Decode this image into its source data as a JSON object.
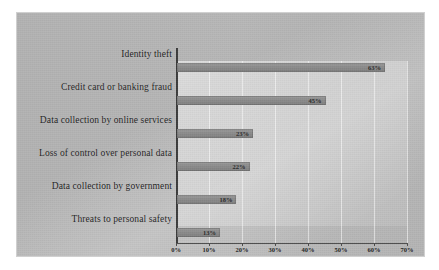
{
  "chart_data": {
    "type": "bar",
    "orientation": "horizontal",
    "title": "",
    "subtitle": "",
    "xlabel": "",
    "ylabel": "",
    "xlim": [
      0,
      70
    ],
    "grid": true,
    "legend": false,
    "legend_position": "none",
    "categories": [
      "Identity theft",
      "Credit card or banking fraud",
      "Data collection by online services",
      "Loss of control over personal data",
      "Data collection by government",
      "Threats to personal safety"
    ],
    "values": [
      63,
      45,
      23,
      22,
      18,
      13
    ],
    "value_labels": [
      "63%",
      "45%",
      "23%",
      "22%",
      "18%",
      "13%"
    ],
    "xticks": [
      0,
      10,
      20,
      30,
      40,
      50,
      60,
      70
    ],
    "xtick_labels": [
      "0%",
      "10%",
      "20%",
      "30%",
      "40%",
      "50%",
      "60%",
      "70%"
    ]
  },
  "style": {
    "page_background": "#ffffff",
    "panel_background": "#b5b5b5",
    "plot_background": "#d8d8d8",
    "bar_color": "#8b8b8b",
    "axis_color": "#3b3b3b",
    "gridline_color": "#ffffff",
    "text_color": "#1c1c1c"
  }
}
